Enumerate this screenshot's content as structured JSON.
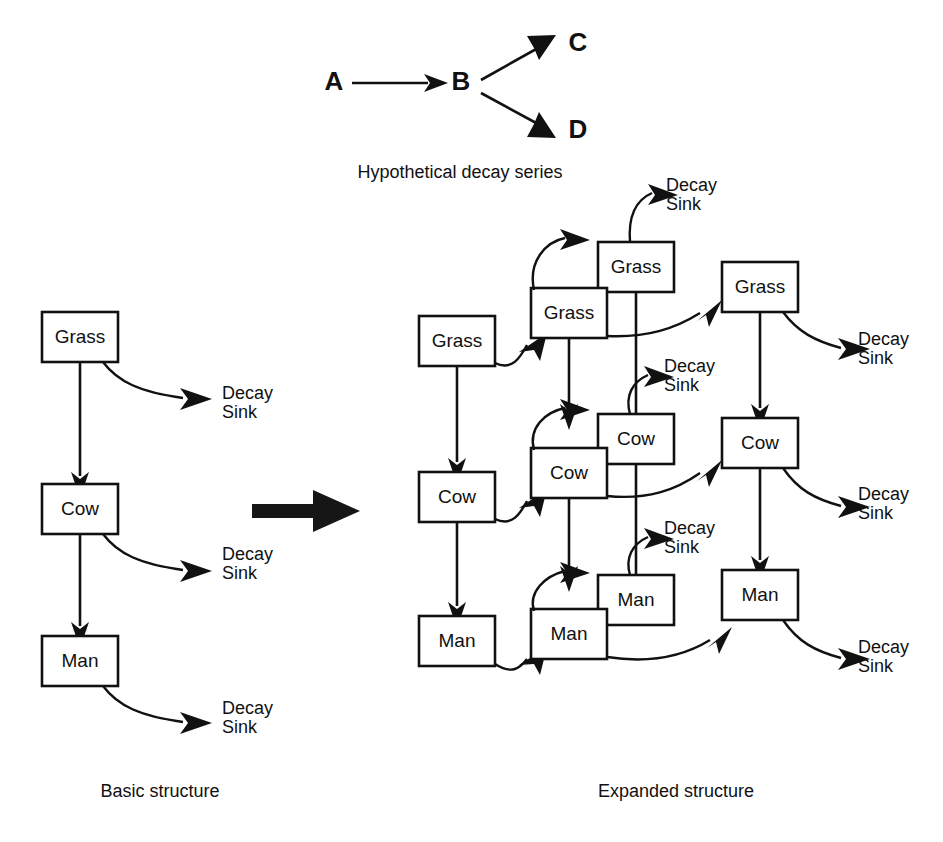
{
  "figure": {
    "background_color": "#ffffff",
    "ink_color": "#111111"
  },
  "decay_series": {
    "caption": "Hypothetical decay series",
    "nodes": [
      {
        "id": "A",
        "label": "A"
      },
      {
        "id": "B",
        "label": "B"
      },
      {
        "id": "C",
        "label": "C"
      },
      {
        "id": "D",
        "label": "D"
      }
    ],
    "edges": [
      {
        "from": "A",
        "to": "B"
      },
      {
        "from": "B",
        "to": "C"
      },
      {
        "from": "B",
        "to": "D"
      }
    ]
  },
  "basic_structure": {
    "caption": "Basic structure",
    "compartments": [
      {
        "id": "grass",
        "label": "Grass"
      },
      {
        "id": "cow",
        "label": "Cow"
      },
      {
        "id": "man",
        "label": "Man"
      }
    ],
    "sink_label_line1": "Decay",
    "sink_label_line2": "Sink",
    "sinks": [
      {
        "from": "grass",
        "line1": "Decay",
        "line2": "Sink"
      },
      {
        "from": "cow",
        "line1": "Decay",
        "line2": "Sink"
      },
      {
        "from": "man",
        "line1": "Decay",
        "line2": "Sink"
      }
    ],
    "transfers": [
      {
        "from": "grass",
        "to": "cow"
      },
      {
        "from": "cow",
        "to": "man"
      }
    ]
  },
  "transition": {
    "name": "expands-to-arrow"
  },
  "expanded_structure": {
    "caption": "Expanded structure",
    "columns": [
      {
        "id": "parent-column",
        "compartments": [
          {
            "id": "grass-parent",
            "label": "Grass"
          },
          {
            "id": "cow-parent",
            "label": "Cow"
          },
          {
            "id": "man-parent",
            "label": "Man"
          }
        ]
      },
      {
        "id": "daughter-column",
        "compartments": [
          {
            "id": "grass-daughter-front",
            "label": "Grass"
          },
          {
            "id": "grass-daughter-back",
            "label": "Grass"
          },
          {
            "id": "cow-daughter-front",
            "label": "Cow"
          },
          {
            "id": "cow-daughter-back",
            "label": "Cow"
          },
          {
            "id": "man-daughter-front",
            "label": "Man"
          },
          {
            "id": "man-daughter-back",
            "label": "Man"
          }
        ]
      },
      {
        "id": "granddaughter-column",
        "compartments": [
          {
            "id": "grass-gd",
            "label": "Grass"
          },
          {
            "id": "cow-gd",
            "label": "Cow"
          },
          {
            "id": "man-gd",
            "label": "Man"
          }
        ]
      }
    ],
    "sinks": [
      {
        "id": "sink-grass-daughter",
        "line1": "Decay",
        "line2": "Sink"
      },
      {
        "id": "sink-grass-gd",
        "line1": "Decay",
        "line2": "Sink"
      },
      {
        "id": "sink-cow-daughter",
        "line1": "Decay",
        "line2": "Sink"
      },
      {
        "id": "sink-cow-gd",
        "line1": "Decay",
        "line2": "Sink"
      },
      {
        "id": "sink-man-daughter",
        "line1": "Decay",
        "line2": "Sink"
      },
      {
        "id": "sink-man-gd",
        "line1": "Decay",
        "line2": "Sink"
      }
    ]
  }
}
